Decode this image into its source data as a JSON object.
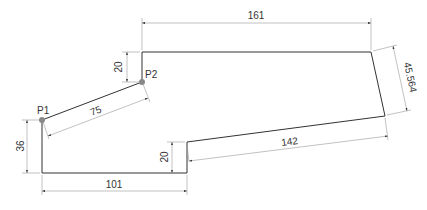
{
  "drawing": {
    "colors": {
      "background": "#ffffff",
      "outline": "#333333",
      "dimension": "#888888",
      "point": "#888888",
      "text": "#333333"
    },
    "points": [
      {
        "label": "P1"
      },
      {
        "label": "P2"
      }
    ],
    "dimensions": {
      "top_width": "161",
      "top_offset_height": "20",
      "right_slant": "45.564",
      "slope_length": "75",
      "left_height": "36",
      "step_height": "20",
      "bottom_slope": "142",
      "bottom_width": "101"
    }
  }
}
